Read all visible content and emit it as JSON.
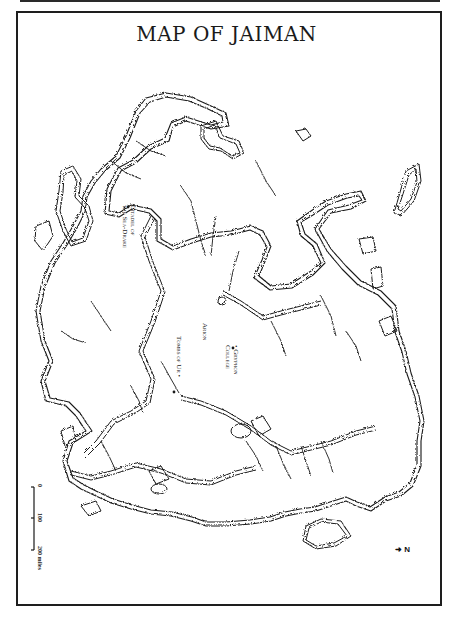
{
  "page": {
    "title": "MAP OF JAIMAN"
  },
  "map": {
    "region": "Jaiman",
    "labels": [
      {
        "id": "citadel",
        "text": "Citadel of\nthe Sea-Drake",
        "line1": "Citadel of",
        "line2": "the Sea-Drake"
      },
      {
        "id": "arion",
        "text": "Arion"
      },
      {
        "id": "gryphon",
        "text": "Gryphon College",
        "line1": "• Gryphon",
        "line2": "College"
      },
      {
        "id": "tombs",
        "text": "Tombs of Ur •"
      }
    ],
    "scale": {
      "ticks": [
        "0",
        "100",
        "200 miles"
      ],
      "unit": "miles"
    },
    "compass": {
      "label": "N",
      "glyph": "➜"
    },
    "colors": {
      "ink": "#1a1a1a",
      "paper": "#ffffff",
      "frame": "#1e1e1e"
    }
  }
}
